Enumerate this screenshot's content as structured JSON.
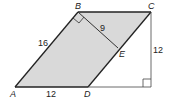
{
  "diagram": {
    "type": "geometry",
    "shape": "parallelogram ABCD",
    "fill_color": "#d9d9d9",
    "stroke_color": "#222222",
    "points": {
      "A": "A",
      "B": "B",
      "C": "C",
      "D": "D",
      "E": "E"
    },
    "measures": {
      "AB": "16",
      "AD": "12",
      "BE": "9",
      "height": "12"
    }
  }
}
